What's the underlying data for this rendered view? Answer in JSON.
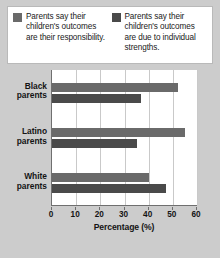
{
  "legend": {
    "items": [
      {
        "icon": "color-swatch-icon",
        "color": "#6a6a6a",
        "label": "Parents say their children's outcomes are their responsibility."
      },
      {
        "icon": "color-swatch-icon",
        "color": "#4a4a4a",
        "label": "Parents say their children's outcomes are due to individual strengths."
      }
    ]
  },
  "chart_data": {
    "type": "bar",
    "orientation": "horizontal",
    "title": "",
    "xlabel": "Percentage (%)",
    "ylabel": "",
    "xlim": [
      0,
      60
    ],
    "xticks": [
      0,
      10,
      20,
      30,
      40,
      50,
      60
    ],
    "xtick_labels": [
      "0",
      "10",
      "20",
      "30",
      "40",
      "50",
      "60"
    ],
    "grid": "vertical",
    "legend_position": "top",
    "categories": [
      "Black parents",
      "Latino parents",
      "White parents"
    ],
    "category_lines": [
      [
        "Black",
        "parents"
      ],
      [
        "Latino",
        "parents"
      ],
      [
        "White",
        "parents"
      ]
    ],
    "series": [
      {
        "name": "Parents say their children's outcomes are their responsibility.",
        "color": "#6a6a6a",
        "values": [
          52,
          55,
          40
        ]
      },
      {
        "name": "Parents say their children's outcomes are due to individual strengths.",
        "color": "#4a4a4a",
        "values": [
          37,
          35,
          47
        ]
      }
    ]
  },
  "colors": {
    "background": "#cccccc",
    "plot_background": "#ffffff",
    "axis": "#6f6f6f",
    "grid": "#c9c9c9",
    "series_1": "#6a6a6a",
    "series_2": "#4a4a4a"
  }
}
